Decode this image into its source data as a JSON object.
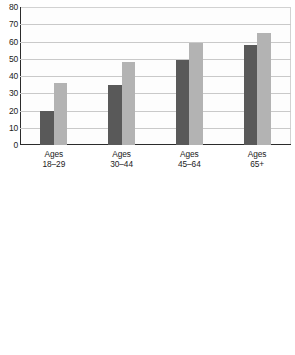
{
  "colors": {
    "series_2014": "#595959",
    "series_2018": "#b3b3b3",
    "axis": "#2b2b2b",
    "gridline": "#c9c9c9",
    "background": "#ffffff"
  },
  "legend": {
    "entries": [
      {
        "label": "2014",
        "color": "#595959"
      },
      {
        "label": "2018",
        "color": "#b3b3b3"
      }
    ]
  },
  "chart_data": [
    {
      "type": "bar",
      "id": "by-age",
      "title": "",
      "xlabel": "",
      "ylabel": "",
      "ylim": [
        0,
        80
      ],
      "yticks": [
        0,
        10,
        20,
        30,
        40,
        50,
        60,
        70,
        80
      ],
      "ytick_labels": [
        "0",
        "10",
        "20",
        "30",
        "40",
        "50",
        "60",
        "70",
        "80"
      ],
      "grid": true,
      "legend_position": "none",
      "categories": [
        "Ages\n18–29",
        "Ages\n30–44",
        "Ages\n45–64",
        "Ages\n65+"
      ],
      "series": [
        {
          "name": "2014",
          "color": "#595959",
          "values": [
            19.5,
            35,
            49,
            58
          ]
        },
        {
          "name": "2018",
          "color": "#b3b3b3",
          "values": [
            36,
            48,
            59,
            65
          ]
        }
      ]
    },
    {
      "type": "bar",
      "id": "by-education",
      "title": "",
      "xlabel": "",
      "ylabel": "",
      "ylim": [
        0,
        80
      ],
      "yticks": [
        0,
        10,
        20,
        30,
        40,
        50,
        60,
        70,
        80
      ],
      "ytick_labels": [
        "0",
        "10",
        "20",
        "30",
        "40",
        "50",
        "60",
        "70",
        "80"
      ],
      "grid": true,
      "legend_position": "top-left",
      "categories": [
        "Less than\nhigh school",
        "High school,\nno college",
        "Some\ncollege",
        "Bachelor´s\ndegree",
        "Degree past\ncollege"
      ],
      "series": [
        {
          "name": "2014",
          "color": "#595959",
          "values": [
            21.5,
            33,
            41,
            52,
            61
          ]
        },
        {
          "name": "2018",
          "color": "#b3b3b3",
          "values": [
            26.5,
            41,
            54,
            65,
            73
          ]
        }
      ]
    }
  ]
}
